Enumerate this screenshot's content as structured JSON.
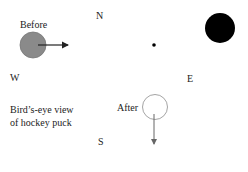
{
  "compass": {
    "north": "N",
    "south": "S",
    "east": "E",
    "west": "W"
  },
  "labels": {
    "before": "Before",
    "after": "After",
    "caption_line1": "Bird’s-eye view",
    "caption_line2": "of hockey puck"
  },
  "colors": {
    "before_puck": "#8a8a8a",
    "after_puck_outline": "#9a9a9a",
    "obstacle": "#000000",
    "arrow": "#222222"
  }
}
